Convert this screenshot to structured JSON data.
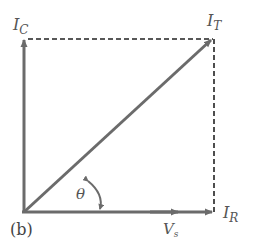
{
  "figure": {
    "caption": "(b)",
    "type": "phasor diagram",
    "colors": {
      "vector": "#6b6b6b",
      "dashed": "#222222",
      "label": "#555555"
    },
    "vectors": {
      "capacitor_current": {
        "symbol": "I",
        "subscript": "C",
        "direction": "up"
      },
      "total_current": {
        "symbol": "I",
        "subscript": "T",
        "direction": "diagonal"
      },
      "resistor_current": {
        "symbol": "I",
        "subscript": "R",
        "direction": "right"
      },
      "source_voltage": {
        "symbol": "V",
        "subscript": "s",
        "direction": "right"
      }
    },
    "angle": {
      "symbol": "θ"
    }
  }
}
